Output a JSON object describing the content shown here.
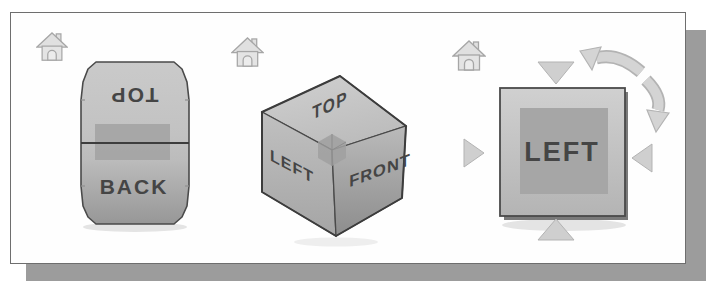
{
  "panel": {
    "background": "#fefefe",
    "border_color": "#6e6e6e",
    "shadow_color": "#9c9c9c"
  },
  "widgets": {
    "rotation_preview": {
      "description_name": "viewcube-edge-rotation-state",
      "labels": {
        "top": "TOP",
        "back": "BACK"
      },
      "top_label_rotation_deg": 180,
      "edge_highlight_color": "#a2a2a2",
      "face_color": "#c4c4c4",
      "home_icon": "home-icon"
    },
    "isometric_cube": {
      "description_name": "viewcube-isometric-state",
      "labels": {
        "top": "TOP",
        "left": "LEFT",
        "front": "FRONT"
      },
      "corner_highlight_color": "#a0a0a0",
      "top_face_color": "#c9c9c9",
      "left_face_color": "#b2b2b2",
      "front_face_color": "#9d9d9d",
      "home_icon": "home-icon"
    },
    "face_view": {
      "description_name": "viewcube-face-view-state",
      "labels": {
        "face": "LEFT"
      },
      "inner_highlight_color": "#a6a6a6",
      "face_color": "#c8c8c8",
      "arrow_color": "#cfcfcf",
      "home_icon": "home-icon",
      "arrows": [
        "tilt-arrow-top",
        "tilt-arrow-bottom",
        "tilt-arrow-left",
        "tilt-arrow-right",
        "roll-arrow-ccw",
        "roll-arrow-cw"
      ]
    }
  }
}
